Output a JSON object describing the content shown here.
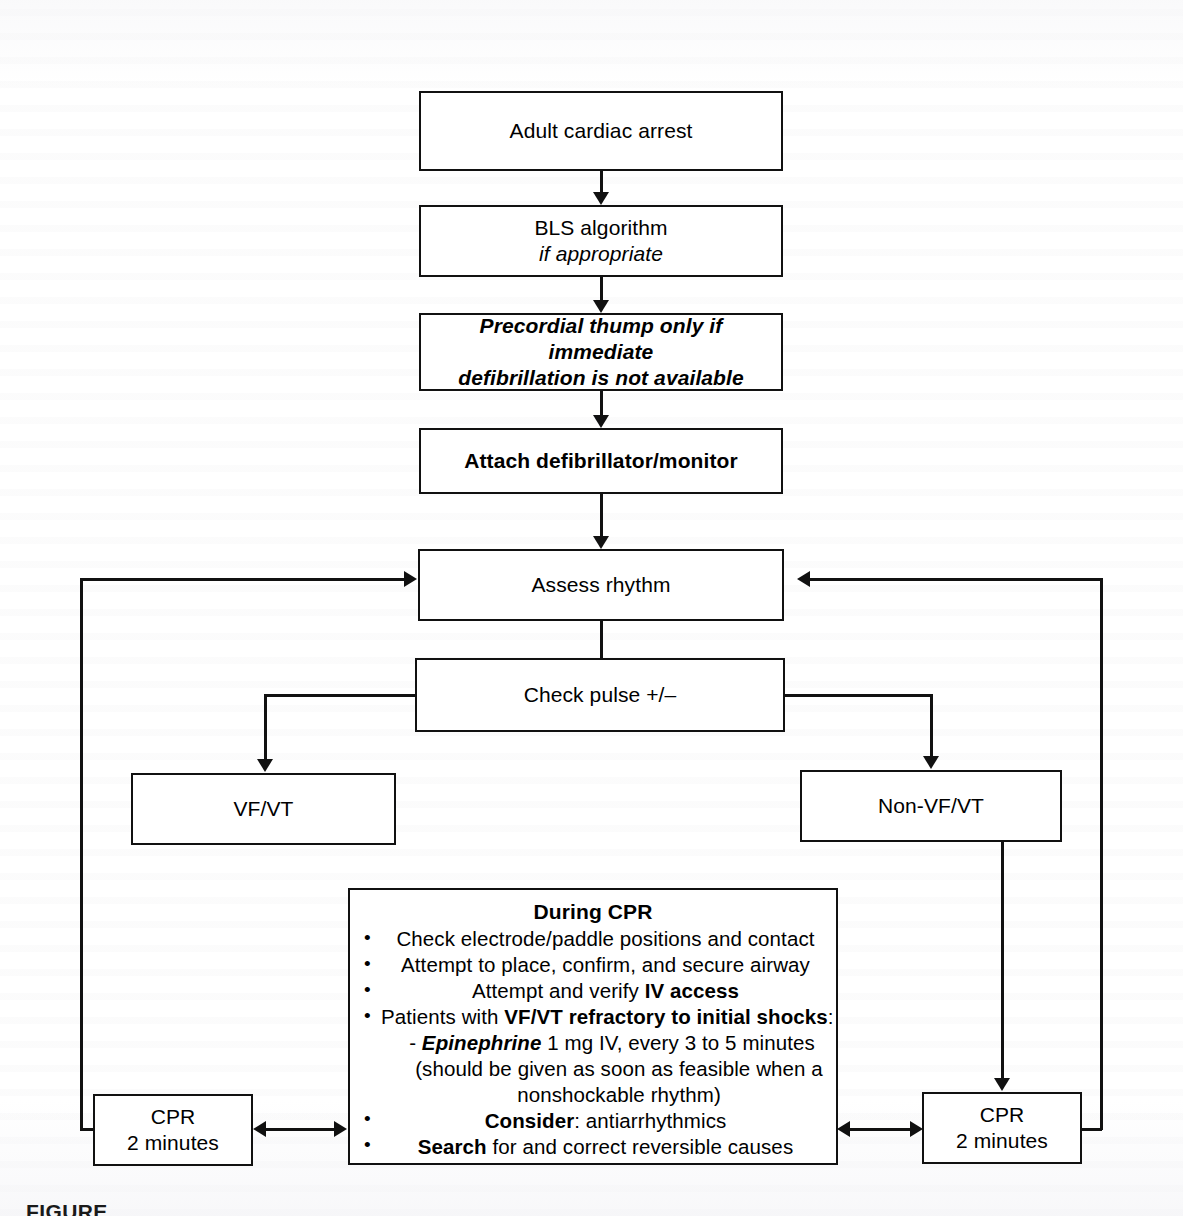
{
  "figure": {
    "domain": "flowchart",
    "caption": "FIGURE",
    "ink_color": "#111111",
    "page_color": "#ffffff"
  },
  "nodes": {
    "adult_cardiac_arrest": {
      "label": "Adult cardiac arrest",
      "style": "regular"
    },
    "bls_algorithm": {
      "line1": "BLS algorithm",
      "line2": "if appropriate",
      "style": "line2-italic"
    },
    "precordial_thump": {
      "line1": "Precordial thump only if immediate",
      "line2": "defibrillation is not available",
      "style": "bold-italic"
    },
    "attach_defibrillator": {
      "label": "Attach defibrillator/monitor",
      "style": "bold"
    },
    "assess_rhythm": {
      "label": "Assess rhythm",
      "style": "regular"
    },
    "check_pulse": {
      "label": "Check pulse +/–",
      "style": "regular"
    },
    "vf_vt": {
      "label": "VF/VT",
      "style": "regular"
    },
    "non_vf_vt": {
      "label": "Non-VF/VT",
      "style": "regular"
    },
    "cpr_left": {
      "line1": "CPR",
      "line2": "2 minutes",
      "style": "regular"
    },
    "cpr_right": {
      "line1": "CPR",
      "line2": "2 minutes",
      "style": "regular"
    }
  },
  "during_cpr": {
    "title": "During CPR",
    "bullets": [
      {
        "text": "Check electrode/paddle positions and contact"
      },
      {
        "text": "Attempt to place, confirm, and secure airway"
      },
      {
        "pre": "Attempt and verify ",
        "bold": "IV access",
        "post": ""
      },
      {
        "pre": "Patients with ",
        "bold": "VF/VT refractory to initial shocks",
        "post": ":"
      },
      {
        "pre": "",
        "bold": "Consider",
        "post": ": antiarrhythmics"
      },
      {
        "pre": "",
        "bold": "Search",
        "post": " for and correct reversible causes"
      }
    ],
    "sub_items": [
      {
        "dash": "- ",
        "bold_italic": "Epinephrine",
        "rest": " 1 mg IV, every 3 to 5 minutes"
      },
      {
        "cont": "(should be given as soon as feasible when a"
      },
      {
        "cont": "nonshockable rhythm)"
      }
    ]
  }
}
